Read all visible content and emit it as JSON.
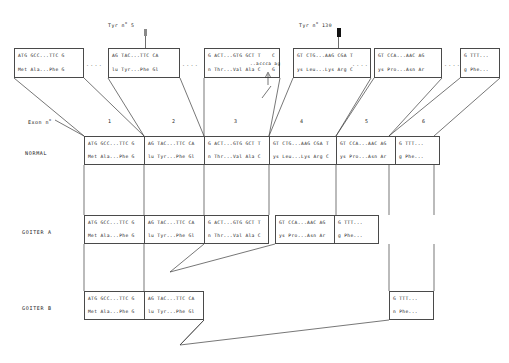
{
  "figure": {
    "title_markers": [
      {
        "name": "tyr-marker-5",
        "label_pre": "Tyr n",
        "label_sup": "o",
        "label_post": " 5",
        "x": 146,
        "text_x": 108,
        "text_y": 25
      },
      {
        "name": "tyr-marker-130",
        "label_pre": "Tyr n",
        "label_sup": "o",
        "label_post": " 130",
        "x": 339,
        "text_x": 299,
        "text_y": 25
      }
    ],
    "exon_axis_label_pre": "Exon n",
    "exon_axis_label_sup": "o",
    "exon_numbers": [
      "1",
      "2",
      "3",
      "4",
      "5",
      "6"
    ],
    "row_labels": {
      "normal": "NORMAL",
      "goiter_a": "GOITER A",
      "goiter_b": "GOITER B"
    },
    "splice_annotation": {
      "sequence": "..accca ag",
      "base_above": "C",
      "base_below": "G"
    },
    "ellipsis": "...."
  },
  "top_boxes": [
    {
      "name": "top-box-exon-1",
      "nt": "ATG GCC...TTC G",
      "aa": "Met Ala...Phe G"
    },
    {
      "name": "top-box-exon-2",
      "nt": "AG TAC...TTC CA",
      "aa": "lu Tyr...Phe Gl"
    },
    {
      "name": "top-box-exon-3",
      "nt": "G ACT...GTG GCT T",
      "aa": "n Thr...Val Ala C"
    },
    {
      "name": "top-box-exon-4",
      "nt": "GT CTG...AAG CGA T",
      "aa": "ys Leu...Lys Arg C"
    },
    {
      "name": "top-box-exon-5",
      "nt": "GT CCA...AAC AG",
      "aa": "ys Pro...Asn Ar"
    },
    {
      "name": "top-box-exon-6",
      "nt": "G TTT...",
      "aa": "g Phe..."
    }
  ],
  "normal_row": [
    {
      "name": "normal-exon-1",
      "nt": "ATG GCC...TTC G",
      "aa": "Met Ala...Phe G"
    },
    {
      "name": "normal-exon-2",
      "nt": "AG TAC...TTC CA",
      "aa": "lu Tyr...Phe Gl"
    },
    {
      "name": "normal-exon-3",
      "nt": "G ACT...GTG GCT T",
      "aa": "n Thr...Val Ala C"
    },
    {
      "name": "normal-exon-4",
      "nt": "GT CTG...AAG CGA T",
      "aa": "ys Leu...Lys Arg C"
    },
    {
      "name": "normal-exon-5",
      "nt": "GT CCA...AAC AG",
      "aa": "ys Pro...Asn Ar"
    },
    {
      "name": "normal-exon-6",
      "nt": "G TTT...",
      "aa": "g Phe..."
    }
  ],
  "goiter_a_row": [
    {
      "name": "goiter-a-exon-1",
      "nt": "ATG GCC...TTC G",
      "aa": "Met Ala...Phe G"
    },
    {
      "name": "goiter-a-exon-2",
      "nt": "AG TAC...TTC CA",
      "aa": "lu Tyr...Phe Gl"
    },
    {
      "name": "goiter-a-exon-3",
      "nt": "G ACT...GTG GCT T",
      "aa": "n Thr...Val Ala C"
    },
    {
      "name": "goiter-a-exon-5",
      "nt": "GT CCA...AAC AG",
      "aa": "ys Pro...Asn Ar"
    },
    {
      "name": "goiter-a-exon-6",
      "nt": "G TTT...",
      "aa": "g Phe..."
    }
  ],
  "goiter_b_row": [
    {
      "name": "goiter-b-exon-1",
      "nt": "ATG GCC...TTC G",
      "aa": "Met Ala...Phe G"
    },
    {
      "name": "goiter-b-exon-2",
      "nt": "AG TAC...TTC CA",
      "aa": "lu Tyr...Phe Gl"
    },
    {
      "name": "goiter-b-exon-6",
      "nt": "G TTT...",
      "aa": "n Phe..."
    }
  ],
  "colors": {
    "stroke": "#3c3c3c",
    "marker": "#111111",
    "background": "#ffffff"
  }
}
